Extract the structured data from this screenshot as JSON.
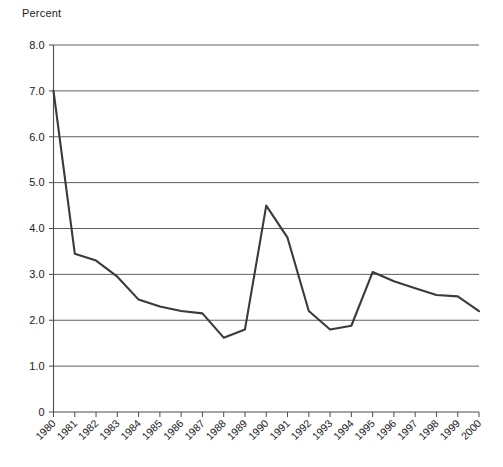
{
  "chart_data": {
    "type": "line",
    "title": "",
    "subtitle": "",
    "xlabel": "",
    "ylabel": "Percent",
    "ylim": [
      0,
      8.0
    ],
    "grid": true,
    "legend": false,
    "y_ticks": [
      "0",
      "1.0",
      "2.0",
      "3.0",
      "4.0",
      "5.0",
      "6.0",
      "7.0",
      "8.0"
    ],
    "y_tick_values": [
      0,
      1.0,
      2.0,
      3.0,
      4.0,
      5.0,
      6.0,
      7.0,
      8.0
    ],
    "categories": [
      "1980",
      "1981",
      "1982",
      "1983",
      "1984",
      "1985",
      "1986",
      "1987",
      "1988",
      "1989",
      "1990",
      "1991",
      "1992",
      "1993",
      "1994",
      "1995",
      "1996",
      "1997",
      "1998",
      "1999",
      "2000"
    ],
    "values": [
      7.0,
      3.45,
      3.3,
      2.95,
      2.45,
      2.3,
      2.2,
      2.15,
      1.62,
      1.8,
      4.5,
      3.8,
      2.2,
      1.8,
      1.88,
      3.05,
      2.85,
      2.7,
      2.55,
      2.52,
      2.2
    ],
    "series": [
      {
        "name": "Percent",
        "color": "#3a3a3a",
        "values": [
          7.0,
          3.45,
          3.3,
          2.95,
          2.45,
          2.3,
          2.2,
          2.15,
          1.62,
          1.8,
          4.5,
          3.8,
          2.2,
          1.8,
          1.88,
          3.05,
          2.85,
          2.7,
          2.55,
          2.52,
          2.2
        ]
      }
    ],
    "annotations": []
  },
  "axes": {
    "y_title": "Percent"
  },
  "colors": {
    "line": "#3a3a3a",
    "grid": "#4d4d4d",
    "axis": "#4d4d4d",
    "text": "#1a1a1a",
    "background": "#ffffff"
  }
}
